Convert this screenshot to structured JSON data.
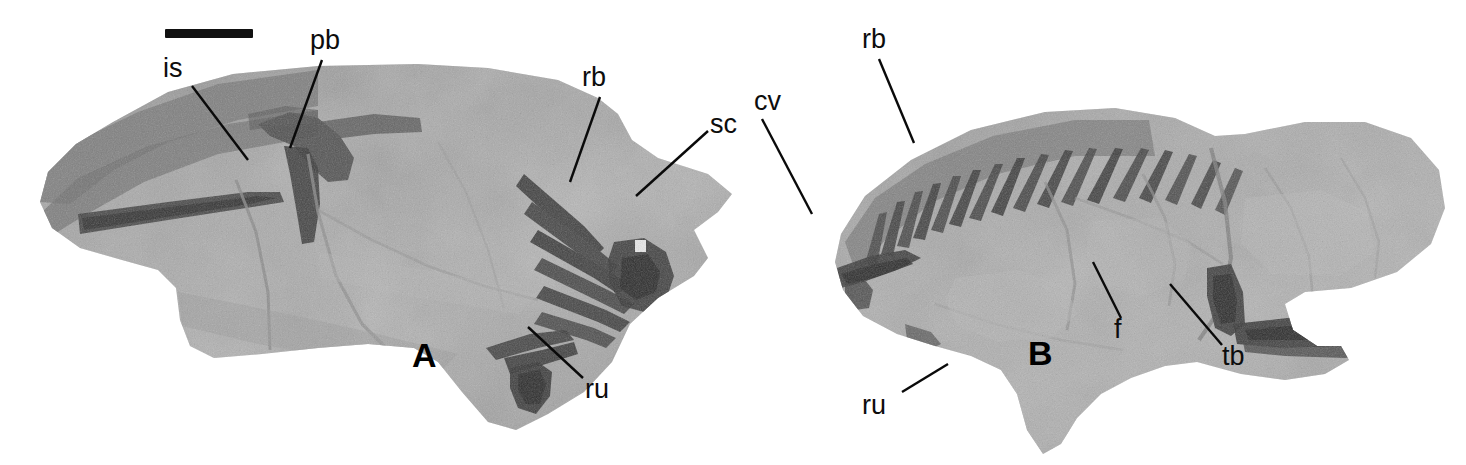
{
  "figure": {
    "width": 1466,
    "height": 465,
    "background": "#ffffff",
    "type": "photographic-plate"
  },
  "scale_bar": {
    "name": "scale-bar",
    "x": 165,
    "y": 29,
    "width": 88,
    "height": 9,
    "color": "#111111"
  },
  "panels": [
    {
      "id": "A",
      "letter": "A",
      "letter_x": 412,
      "letter_y": 338,
      "slab": {
        "x": 18,
        "y": 62,
        "width": 720,
        "height": 372
      }
    },
    {
      "id": "B",
      "letter": "B",
      "letter_x": 1028,
      "letter_y": 336,
      "slab": {
        "x": 745,
        "y": 78,
        "width": 712,
        "height": 382
      }
    }
  ],
  "annotations": [
    {
      "id": "is",
      "label": "is",
      "panel": "A",
      "text_x": 163,
      "text_y": 55,
      "anchor_x": 192,
      "anchor_y": 86,
      "tip_x": 248,
      "tip_y": 160
    },
    {
      "id": "pb",
      "label": "pb",
      "panel": "A",
      "text_x": 310,
      "text_y": 27,
      "anchor_x": 322,
      "anchor_y": 60,
      "tip_x": 290,
      "tip_y": 148
    },
    {
      "id": "rbA",
      "label": "rb",
      "panel": "A",
      "text_x": 582,
      "text_y": 64,
      "anchor_x": 600,
      "anchor_y": 97,
      "tip_x": 570,
      "tip_y": 182
    },
    {
      "id": "sc",
      "label": "sc",
      "panel": "A",
      "text_x": 710,
      "text_y": 111,
      "anchor_x": 708,
      "anchor_y": 131,
      "tip_x": 636,
      "tip_y": 196
    },
    {
      "id": "ruA",
      "label": "ru",
      "panel": "A",
      "text_x": 585,
      "text_y": 376,
      "anchor_x": 583,
      "anchor_y": 378,
      "tip_x": 528,
      "tip_y": 327
    },
    {
      "id": "cv",
      "label": "cv",
      "panel": "B",
      "text_x": 754,
      "text_y": 88,
      "anchor_x": 762,
      "anchor_y": 119,
      "tip_x": 812,
      "tip_y": 214
    },
    {
      "id": "rbB",
      "label": "rb",
      "panel": "B",
      "text_x": 862,
      "text_y": 26,
      "anchor_x": 879,
      "anchor_y": 59,
      "tip_x": 914,
      "tip_y": 143
    },
    {
      "id": "f",
      "label": "f",
      "panel": "B",
      "text_x": 1114,
      "text_y": 316,
      "anchor_x": 1121,
      "anchor_y": 318,
      "tip_x": 1093,
      "tip_y": 262
    },
    {
      "id": "tb",
      "label": "tb",
      "panel": "B",
      "text_x": 1222,
      "text_y": 343,
      "anchor_x": 1222,
      "anchor_y": 345,
      "tip_x": 1170,
      "tip_y": 284
    },
    {
      "id": "ruB",
      "label": "ru",
      "panel": "B",
      "text_x": 862,
      "text_y": 392,
      "anchor_x": 902,
      "anchor_y": 392,
      "tip_x": 948,
      "tip_y": 364
    }
  ],
  "abbreviations": {
    "is": "ischium",
    "pb": "pubis",
    "rb": "rib",
    "sc": "scapula",
    "cv": "cervical vertebrae",
    "ru": "radius and ulna",
    "f": "femur",
    "tb": "tibia"
  },
  "colors": {
    "matrix_light": "#b4b4b4",
    "matrix_mid": "#a3a3a3",
    "matrix_dark": "#858585",
    "bone_dark": "#4a4a4a",
    "bone_darkest": "#343434",
    "label_ink": "#0d0d0d",
    "background": "#ffffff"
  }
}
